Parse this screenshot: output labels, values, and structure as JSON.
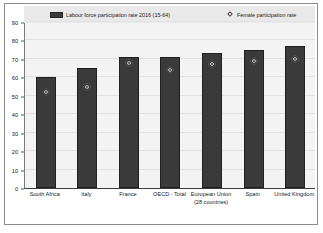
{
  "chart_data": {
    "type": "bar",
    "title": "",
    "xlabel": "",
    "ylabel": "",
    "ylim": [
      0,
      90
    ],
    "yticks": [
      0,
      10,
      20,
      30,
      40,
      50,
      60,
      70,
      80,
      90
    ],
    "grid": true,
    "legend_position": "top",
    "categories": [
      "South Africa",
      "Italy",
      "France",
      "OECD - Total",
      "European Union (28 countries)",
      "Spain",
      "United Kingdom"
    ],
    "series": [
      {
        "name": "Labour force participation rate 2016 (15-64)",
        "type": "bar",
        "color": "#3a3a3a",
        "values": [
          60,
          65,
          71,
          71,
          73,
          75,
          77
        ]
      },
      {
        "name": "Female participation rate",
        "type": "marker",
        "marker": "diamond",
        "color": "#ffffff",
        "values": [
          52,
          55,
          68,
          64,
          67,
          69,
          70
        ]
      }
    ]
  },
  "legend": {
    "entries": [
      {
        "label": "Labour force participation rate 2016 (15-64)",
        "icon": "bar-swatch"
      },
      {
        "label": "Female participation rate",
        "icon": "diamond-swatch"
      }
    ]
  },
  "axis": {
    "y_labels": [
      "90",
      "80",
      "70",
      "60",
      "50",
      "40",
      "30",
      "20",
      "10",
      "0"
    ]
  },
  "xlabels": [
    "South Africa",
    "Italy",
    "France",
    "OECD - Total",
    "European Union (28 countries)",
    "Spain",
    "United Kingdom"
  ],
  "colors": {
    "bar": "#3a3a3a",
    "marker": "#ffffff",
    "plot_background": "#f3f3f3",
    "legend_background": "#e9e9e9",
    "frame": "#8c8c8c"
  }
}
